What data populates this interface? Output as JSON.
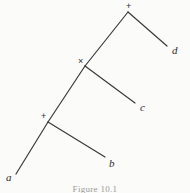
{
  "figure": {
    "caption": "Figure 10.1",
    "background_color": "#fbfbfa",
    "line_color": "#3a3a3a",
    "text_color": "#2b2b2b"
  },
  "nodes": [
    {
      "id": "root",
      "mark": "+",
      "mark_x": 126,
      "mark_y": 2,
      "x": 128,
      "y": 12
    },
    {
      "id": "internal-mid",
      "mark": "×",
      "mark_x": 78,
      "mark_y": 57,
      "x": 85,
      "y": 66
    },
    {
      "id": "internal-low",
      "mark": "+",
      "mark_x": 41,
      "mark_y": 112,
      "x": 48,
      "y": 122
    }
  ],
  "edges": [
    {
      "id": "root-to-d",
      "from": "root",
      "to": "d",
      "x1": 128,
      "y1": 12,
      "x2": 167,
      "y2": 46
    },
    {
      "id": "root-to-mid",
      "from": "root",
      "to": "internal-mid",
      "x1": 128,
      "y1": 12,
      "x2": 85,
      "y2": 66
    },
    {
      "id": "mid-to-c",
      "from": "internal-mid",
      "to": "c",
      "x1": 85,
      "y1": 66,
      "x2": 135,
      "y2": 103
    },
    {
      "id": "mid-to-low",
      "from": "internal-mid",
      "to": "internal-low",
      "x1": 85,
      "y1": 66,
      "x2": 48,
      "y2": 122
    },
    {
      "id": "low-to-b",
      "from": "internal-low",
      "to": "b",
      "x1": 48,
      "y1": 122,
      "x2": 105,
      "y2": 157
    },
    {
      "id": "low-to-a",
      "from": "internal-low",
      "to": "a",
      "x1": 48,
      "y1": 122,
      "x2": 16,
      "y2": 174
    }
  ],
  "leaves": [
    {
      "id": "a",
      "label": "a",
      "x": 6,
      "y": 172
    },
    {
      "id": "b",
      "label": "b",
      "x": 109,
      "y": 158
    },
    {
      "id": "c",
      "label": "c",
      "x": 140,
      "y": 102
    },
    {
      "id": "d",
      "label": "d",
      "x": 172,
      "y": 45
    }
  ]
}
